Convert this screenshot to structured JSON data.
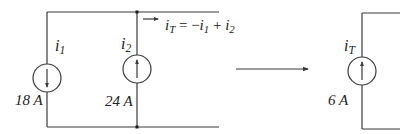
{
  "diagram": {
    "colors": {
      "wire": "#3a3a3a",
      "text": "#222222",
      "background": "#ffffff"
    },
    "left_circuit": {
      "source1": {
        "symbol": "i",
        "subscript": "1",
        "value": "18 A",
        "direction": "down"
      },
      "source2": {
        "symbol": "i",
        "subscript": "2",
        "value": "24 A",
        "direction": "up"
      },
      "equation": {
        "lhs_symbol": "i",
        "lhs_subscript": "T",
        "equals": " = −",
        "t1_symbol": "i",
        "t1_subscript": "1",
        "plus": " + ",
        "t2_symbol": "i",
        "t2_subscript": "2"
      }
    },
    "transform_arrow": "arrow-right",
    "right_circuit": {
      "source": {
        "symbol": "i",
        "subscript": "T",
        "value": "6 A",
        "direction": "up"
      }
    }
  }
}
